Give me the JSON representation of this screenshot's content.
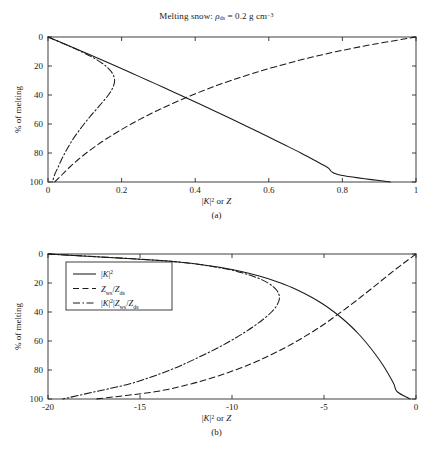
{
  "figure": {
    "title_plain": "Melting snow: ρds = 0.2 g cm-3",
    "panel_a_caption": "(a)",
    "panel_b_caption": "(b)",
    "ylabel": "% of melting",
    "xlabel_plain": "|K|2 or Z"
  },
  "chart_data": [
    {
      "type": "line",
      "panel": "(a)",
      "title": "Melting snow: ρds = 0.2 g cm⁻³",
      "xlabel": "|K|² or Z",
      "ylabel": "% of melting",
      "xlim": [
        0,
        1
      ],
      "ylim": [
        100,
        0
      ],
      "y_inverted": true,
      "xticks": [
        0,
        0.2,
        0.4,
        0.6,
        0.8,
        1
      ],
      "xticklabels": [
        "0",
        "0.2",
        "0.4",
        "0.6",
        "0.8",
        "1"
      ],
      "yticks": [
        0,
        20,
        40,
        60,
        80,
        100
      ],
      "yticklabels": [
        "0",
        "20",
        "40",
        "60",
        "80",
        "100"
      ],
      "grid": false,
      "legend": "none",
      "series": [
        {
          "name": "|K|²",
          "style": "solid",
          "color": "#1a1a1a",
          "y": [
            0,
            5,
            10,
            15,
            20,
            25,
            30,
            35,
            40,
            45,
            50,
            55,
            60,
            65,
            70,
            75,
            80,
            85,
            90,
            95,
            100
          ],
          "x": [
            0.0,
            0.047,
            0.093,
            0.139,
            0.184,
            0.228,
            0.272,
            0.316,
            0.359,
            0.402,
            0.444,
            0.486,
            0.527,
            0.568,
            0.608,
            0.648,
            0.687,
            0.724,
            0.76,
            0.79,
            0.93
          ]
        },
        {
          "name": "Zws/Zds",
          "style": "dashed",
          "color": "#1a1a1a",
          "y": [
            0,
            5,
            10,
            15,
            20,
            25,
            30,
            35,
            40,
            45,
            50,
            55,
            60,
            65,
            70,
            75,
            80,
            85,
            90,
            95,
            100
          ],
          "x": [
            1.0,
            0.885,
            0.785,
            0.7,
            0.625,
            0.558,
            0.497,
            0.442,
            0.392,
            0.346,
            0.303,
            0.263,
            0.226,
            0.192,
            0.16,
            0.131,
            0.104,
            0.08,
            0.058,
            0.038,
            0.018
          ]
        },
        {
          "name": "|K|²|Zws/Zds",
          "style": "dashdot",
          "color": "#1a1a1a",
          "y": [
            0,
            5,
            10,
            15,
            20,
            25,
            30,
            35,
            40,
            45,
            50,
            55,
            60,
            65,
            70,
            75,
            80,
            85,
            90,
            95,
            100
          ],
          "x": [
            0.0,
            0.046,
            0.09,
            0.128,
            0.157,
            0.175,
            0.181,
            0.176,
            0.164,
            0.148,
            0.131,
            0.114,
            0.098,
            0.083,
            0.069,
            0.057,
            0.046,
            0.036,
            0.027,
            0.018,
            0.012
          ]
        }
      ]
    },
    {
      "type": "line",
      "panel": "(b)",
      "xlabel": "|K|² or Z",
      "ylabel": "% of melting",
      "xlim": [
        -20,
        0
      ],
      "ylim": [
        100,
        0
      ],
      "y_inverted": true,
      "xticks": [
        -20,
        -15,
        -10,
        -5,
        0
      ],
      "xticklabels": [
        "-20",
        "-15",
        "-10",
        "-5",
        "0"
      ],
      "yticks": [
        0,
        20,
        40,
        60,
        80,
        100
      ],
      "yticklabels": [
        "0",
        "20",
        "40",
        "60",
        "80",
        "100"
      ],
      "grid": false,
      "legend": "upper-left",
      "legend_entries": [
        {
          "label_plain": "|K|2",
          "style": "solid"
        },
        {
          "label_plain": "Zws/Zds",
          "style": "dashed"
        },
        {
          "label_plain": "|K|2|Zws/Zds",
          "style": "dashdot"
        }
      ],
      "series": [
        {
          "name": "|K|²",
          "style": "solid",
          "color": "#1a1a1a",
          "y": [
            0,
            5,
            10,
            15,
            20,
            25,
            30,
            35,
            40,
            45,
            50,
            55,
            60,
            65,
            70,
            75,
            80,
            85,
            90,
            95,
            100
          ],
          "x": [
            -20.0,
            -13.3,
            -10.3,
            -8.57,
            -7.35,
            -6.42,
            -5.65,
            -5.0,
            -4.45,
            -3.96,
            -3.52,
            -3.13,
            -2.78,
            -2.46,
            -2.16,
            -1.88,
            -1.63,
            -1.4,
            -1.19,
            -1.02,
            -0.32
          ]
        },
        {
          "name": "Zws/Zds",
          "style": "dashed",
          "color": "#1a1a1a",
          "y": [
            0,
            5,
            10,
            15,
            20,
            25,
            30,
            35,
            40,
            45,
            50,
            55,
            60,
            65,
            70,
            75,
            80,
            85,
            90,
            95,
            100
          ],
          "x": [
            0.0,
            -0.53,
            -1.05,
            -1.55,
            -2.04,
            -2.53,
            -3.03,
            -3.54,
            -4.07,
            -4.61,
            -5.18,
            -5.8,
            -6.46,
            -7.17,
            -7.96,
            -8.83,
            -9.83,
            -10.97,
            -12.36,
            -14.2,
            -17.4
          ]
        },
        {
          "name": "|K|²|Zws/Zds",
          "style": "dashdot",
          "color": "#1a1a1a",
          "y": [
            0,
            5,
            10,
            15,
            20,
            25,
            30,
            35,
            40,
            45,
            50,
            55,
            60,
            65,
            70,
            75,
            80,
            85,
            90,
            95,
            100
          ],
          "x": [
            -20.0,
            -13.4,
            -10.46,
            -8.93,
            -8.04,
            -7.57,
            -7.42,
            -7.54,
            -7.85,
            -8.3,
            -8.83,
            -9.43,
            -10.09,
            -10.81,
            -11.61,
            -12.44,
            -13.37,
            -14.43,
            -15.68,
            -17.45,
            -19.2
          ]
        }
      ]
    }
  ]
}
